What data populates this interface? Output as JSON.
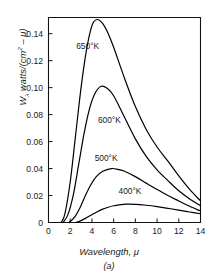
{
  "figure": {
    "caption": "(a)",
    "xlabel": "Wavelength, μ",
    "ylabel_main": "W",
    "ylabel_sub": "λ",
    "ylabel_rest": " watts/(cm",
    "ylabel_sup": "2",
    "ylabel_tail": " – μ)"
  },
  "chart_data": {
    "type": "line",
    "title": "",
    "subtitle": "(a)",
    "xlabel": "Wavelength, μ",
    "ylabel": "Wλ watts/(cm2 - μ)",
    "xlim": [
      0,
      14
    ],
    "ylim": [
      0,
      0.152
    ],
    "xticks": [
      0,
      2,
      4,
      6,
      8,
      10,
      12,
      14
    ],
    "xticklabels": [
      "0",
      "2",
      "4",
      "6",
      "8",
      "10",
      "12",
      "14"
    ],
    "yticks": [
      0,
      0.02,
      0.04,
      0.06,
      0.08,
      0.1,
      0.12,
      0.14
    ],
    "yticklabels": [
      "0",
      "0.02",
      "0.04",
      "0.06",
      "0.08",
      "0.10",
      "0.12",
      "0.14"
    ],
    "grid": false,
    "legend": "inline-annotations",
    "line_color": "#000000",
    "series": [
      {
        "name": "650°K",
        "label": "650°K",
        "label_x": 2.55,
        "label_y": 0.1285,
        "peak_x": 4.45,
        "peak_y": 0.1505,
        "x": [
          1.15,
          1.5,
          2.0,
          2.5,
          3.0,
          3.5,
          4.0,
          4.45,
          5.0,
          5.5,
          6.0,
          7.0,
          8.0,
          9.0,
          10.0,
          11.0,
          12.0,
          13.0,
          14.0
        ],
        "y": [
          0.0,
          0.006,
          0.03,
          0.065,
          0.1,
          0.128,
          0.146,
          0.1505,
          0.1475,
          0.14,
          0.13,
          0.107,
          0.086,
          0.069,
          0.056,
          0.0455,
          0.0345,
          0.0245,
          0.016
        ]
      },
      {
        "name": "600°K",
        "label": "600°K",
        "label_x": 4.55,
        "label_y": 0.0735,
        "peak_x": 4.85,
        "peak_y": 0.101,
        "x": [
          1.35,
          1.8,
          2.3,
          2.8,
          3.3,
          3.8,
          4.3,
          4.85,
          5.4,
          6.0,
          7.0,
          8.0,
          9.0,
          10.0,
          11.0,
          12.0,
          13.0,
          14.0
        ],
        "y": [
          0.0,
          0.006,
          0.021,
          0.044,
          0.067,
          0.085,
          0.096,
          0.101,
          0.0995,
          0.094,
          0.078,
          0.062,
          0.049,
          0.039,
          0.031,
          0.0235,
          0.0175,
          0.0125
        ]
      },
      {
        "name": "500°K",
        "label": "500°K",
        "label_x": 4.25,
        "label_y": 0.0455,
        "peak_x": 5.8,
        "peak_y": 0.04,
        "x": [
          1.9,
          2.4,
          2.9,
          3.4,
          3.9,
          4.4,
          5.0,
          5.8,
          6.5,
          7.0,
          8.0,
          9.0,
          10.0,
          11.0,
          12.0,
          13.0,
          14.0
        ],
        "y": [
          0.0,
          0.004,
          0.011,
          0.02,
          0.028,
          0.034,
          0.038,
          0.04,
          0.0392,
          0.038,
          0.034,
          0.0292,
          0.0245,
          0.02,
          0.016,
          0.012,
          0.0085
        ]
      },
      {
        "name": "400°K",
        "label": "400°K",
        "label_x": 6.45,
        "label_y": 0.0215,
        "peak_x": 7.2,
        "peak_y": 0.0136,
        "x": [
          2.5,
          3.0,
          3.5,
          4.0,
          4.5,
          5.0,
          5.5,
          6.0,
          6.5,
          7.2,
          8.0,
          9.0,
          10.0,
          11.0,
          12.0,
          13.0,
          14.0
        ],
        "y": [
          0.0,
          0.0014,
          0.0035,
          0.0058,
          0.008,
          0.0099,
          0.0113,
          0.0124,
          0.0131,
          0.0136,
          0.0135,
          0.0128,
          0.0118,
          0.0105,
          0.0092,
          0.0078,
          0.0065
        ]
      }
    ]
  }
}
